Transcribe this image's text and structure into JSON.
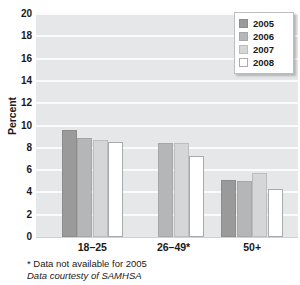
{
  "chart_data": {
    "type": "bar",
    "title": "",
    "subtitle": "",
    "xlabel": "",
    "ylabel": "Percent",
    "ylim": [
      0,
      20
    ],
    "ytick_step": 2,
    "yticks": [
      "20",
      "18",
      "16",
      "14",
      "12",
      "10",
      "8",
      "6",
      "4",
      "2",
      "0"
    ],
    "grid": true,
    "grid_axis": "y",
    "legend_position": "top-right",
    "categories": [
      "18–25",
      "26–49*",
      "50+"
    ],
    "series": [
      {
        "name": "2005",
        "color": "#9a9a9b",
        "values": [
          9.6,
          null,
          5.1
        ]
      },
      {
        "name": "2006",
        "color": "#b5b6b7",
        "values": [
          8.9,
          8.4,
          5.05
        ]
      },
      {
        "name": "2007",
        "color": "#d5d6d7",
        "values": [
          8.7,
          8.4,
          5.75
        ]
      },
      {
        "name": "2008",
        "color": "#ffffff",
        "values": [
          8.5,
          7.3,
          4.35
        ]
      }
    ],
    "annotations": [
      "* Data not available for 2005",
      "Data courtesty of SAMHSA"
    ],
    "plot_background": "#e6e7e8",
    "gridline_color": "#fbfbfb"
  },
  "legend": {
    "items": [
      {
        "label": "2005"
      },
      {
        "label": "2006"
      },
      {
        "label": "2007"
      },
      {
        "label": "2008"
      }
    ]
  },
  "axes": {
    "y_title": "Percent"
  },
  "notes": {
    "asterisk": "* Data not available for 2005",
    "source": "Data courtesty of SAMHSA"
  }
}
